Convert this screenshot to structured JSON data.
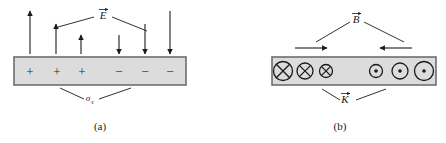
{
  "figure": {
    "panels": [
      {
        "id": "a",
        "caption": "(a)",
        "field_label": "E",
        "field_label_vector": true,
        "surface_label": "σ",
        "surface_label_sub": "s",
        "slab": {
          "x": 14,
          "y": 57,
          "width": 172,
          "height": 28,
          "fill": "#dcdcdc",
          "stroke": "#6e6e6e"
        },
        "charges": [
          {
            "sign": "+",
            "x": 30,
            "y": 71
          },
          {
            "sign": "+",
            "x": 57,
            "y": 71
          },
          {
            "sign": "+",
            "x": 82,
            "y": 71
          },
          {
            "sign": "−",
            "x": 119,
            "y": 71
          },
          {
            "sign": "−",
            "x": 145,
            "y": 71
          },
          {
            "sign": "−",
            "x": 170,
            "y": 71
          }
        ],
        "arrows": [
          {
            "x": 30,
            "tail_y": 54,
            "head_y": 11,
            "dir": "up"
          },
          {
            "x": 56,
            "tail_y": 54,
            "head_y": 24,
            "dir": "up"
          },
          {
            "x": 81,
            "tail_y": 54,
            "head_y": 35,
            "dir": "up"
          },
          {
            "x": 119,
            "tail_y": 35,
            "head_y": 54,
            "dir": "down"
          },
          {
            "x": 145,
            "tail_y": 24,
            "head_y": 54,
            "dir": "down"
          },
          {
            "x": 170,
            "tail_y": 11,
            "head_y": 54,
            "dir": "down"
          }
        ],
        "field_leaders": [
          {
            "x1": 94,
            "y1": 17,
            "x2": 58,
            "y2": 27
          },
          {
            "x1": 112,
            "y1": 17,
            "x2": 147,
            "y2": 31
          }
        ],
        "field_label_pos": {
          "x": 103,
          "y": 19
        },
        "surface_leaders": [
          {
            "x1": 84,
            "y1": 99,
            "x2": 60,
            "y2": 88
          },
          {
            "x1": 99,
            "y1": 99,
            "x2": 131,
            "y2": 88
          }
        ],
        "surface_label_pos": {
          "x": 88,
          "y": 101
        },
        "caption_pos": {
          "x": 100,
          "y": 130
        }
      },
      {
        "id": "b",
        "caption": "(b)",
        "field_label": "B",
        "field_label_vector": true,
        "surface_label": "K",
        "surface_label_vector": true,
        "slab": {
          "x": 272,
          "y": 57,
          "width": 164,
          "height": 28,
          "fill": "#dcdcdc",
          "stroke": "#6e6e6e"
        },
        "into_page": [
          {
            "cx": 283,
            "cy": 71,
            "r": 9.5
          },
          {
            "cx": 305,
            "cy": 71,
            "r": 8.0
          },
          {
            "cx": 326,
            "cy": 71,
            "r": 6.5
          }
        ],
        "out_of_page": [
          {
            "cx": 376,
            "cy": 71,
            "r": 6.5,
            "dot": 1.8
          },
          {
            "cx": 400,
            "cy": 71,
            "r": 8.0,
            "dot": 1.8
          },
          {
            "cx": 424,
            "cy": 71,
            "r": 9.5,
            "dot": 1.8
          }
        ],
        "h_arrows": [
          {
            "y": 48,
            "x_tail": 295,
            "x_head": 327,
            "dir": "right"
          },
          {
            "y": 48,
            "x_tail": 412,
            "x_head": 380,
            "dir": "left"
          }
        ],
        "field_leaders": [
          {
            "x1": 350,
            "y1": 22,
            "x2": 316,
            "y2": 42
          },
          {
            "x1": 364,
            "y1": 22,
            "x2": 404,
            "y2": 42
          }
        ],
        "field_label_pos": {
          "x": 356,
          "y": 23
        },
        "surface_leaders": [
          {
            "x1": 340,
            "y1": 100,
            "x2": 322,
            "y2": 89
          },
          {
            "x1": 356,
            "y1": 100,
            "x2": 386,
            "y2": 89
          }
        ],
        "surface_label_pos": {
          "x": 345,
          "y": 103
        },
        "caption_pos": {
          "x": 340,
          "y": 130
        }
      }
    ]
  }
}
